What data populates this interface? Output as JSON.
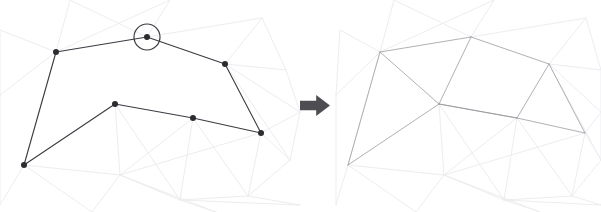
{
  "figure": {
    "width": 601,
    "height": 212,
    "background_color": "#ffffff"
  },
  "colors": {
    "polygon_stroke": "#3b3b42",
    "vertex_fill": "#2b2b30",
    "highlight_circle_stroke": "#3b3b42",
    "triangulation_stroke": "#8f8f96",
    "background_mesh_stroke": "#ededf0",
    "arrow_fill": "#4d4d52"
  },
  "strokes": {
    "polygon_width": 1.1,
    "triangulation_width": 0.7,
    "background_mesh_width": 1.0,
    "highlight_circle_width": 1.2,
    "vertex_radius": 3.0,
    "highlight_circle_radius": 13.0
  },
  "arrow": {
    "name": "right-arrow",
    "glyph": "⮕",
    "x": 300,
    "y": 95,
    "width": 30,
    "height": 21,
    "direction": "right"
  },
  "left_panel": {
    "name": "input-polygon-panel",
    "offset_x": 0,
    "highlight": {
      "name": "selected-vertex-highlight",
      "cx": 147,
      "cy": 37,
      "r": 13
    },
    "vertices": [
      {
        "id": "v0",
        "label": "left-apex",
        "x": 56,
        "y": 52
      },
      {
        "id": "v1",
        "label": "top-selected",
        "x": 147,
        "y": 37
      },
      {
        "id": "v2",
        "label": "right-upper",
        "x": 225,
        "y": 64
      },
      {
        "id": "v3",
        "label": "right-lower",
        "x": 261,
        "y": 133
      },
      {
        "id": "v4",
        "label": "bottom-mid",
        "x": 193,
        "y": 118
      },
      {
        "id": "v5",
        "label": "bottom-peak",
        "x": 115,
        "y": 104
      },
      {
        "id": "v6",
        "label": "bottom-left",
        "x": 24,
        "y": 165
      }
    ],
    "polygon_edges": [
      [
        0,
        1
      ],
      [
        1,
        2
      ],
      [
        2,
        3
      ],
      [
        3,
        4
      ],
      [
        4,
        5
      ],
      [
        5,
        6
      ],
      [
        6,
        0
      ]
    ],
    "triangulation_edges": []
  },
  "right_panel": {
    "name": "triangulated-polygon-panel",
    "offset_x": 324,
    "highlight": null,
    "vertices": [
      {
        "id": "v0",
        "label": "left-apex",
        "x": 380,
        "y": 52
      },
      {
        "id": "v1",
        "label": "top-center",
        "x": 471,
        "y": 37
      },
      {
        "id": "v2",
        "label": "right-upper",
        "x": 549,
        "y": 64
      },
      {
        "id": "v3",
        "label": "right-lower",
        "x": 585,
        "y": 133
      },
      {
        "id": "v4",
        "label": "bottom-mid",
        "x": 517,
        "y": 118
      },
      {
        "id": "v5",
        "label": "bottom-peak",
        "x": 439,
        "y": 104
      },
      {
        "id": "v6",
        "label": "bottom-left",
        "x": 348,
        "y": 165
      }
    ],
    "polygon_edges": [
      [
        0,
        1
      ],
      [
        1,
        2
      ],
      [
        2,
        3
      ],
      [
        3,
        4
      ],
      [
        4,
        5
      ],
      [
        5,
        6
      ],
      [
        6,
        0
      ]
    ],
    "triangulation_edges": [
      [
        0,
        5
      ],
      [
        1,
        5
      ],
      [
        5,
        4
      ],
      [
        2,
        4
      ]
    ]
  },
  "background_mesh": {
    "name": "faint-background-mesh",
    "left": {
      "nodes": [
        {
          "x": 56,
          "y": 52
        },
        {
          "x": 147,
          "y": 37
        },
        {
          "x": 225,
          "y": 64
        },
        {
          "x": 261,
          "y": 133
        },
        {
          "x": 193,
          "y": 118
        },
        {
          "x": 115,
          "y": 104
        },
        {
          "x": 24,
          "y": 165
        },
        {
          "x": 120,
          "y": 175
        },
        {
          "x": 180,
          "y": 200
        },
        {
          "x": 248,
          "y": 196
        },
        {
          "x": 290,
          "y": 160
        },
        {
          "x": 286,
          "y": 70
        },
        {
          "x": 262,
          "y": 18
        },
        {
          "x": 170,
          "y": 0
        },
        {
          "x": 70,
          "y": 0
        },
        {
          "x": 0,
          "y": 30
        },
        {
          "x": 0,
          "y": 95
        },
        {
          "x": 0,
          "y": 205
        },
        {
          "x": 92,
          "y": 212
        },
        {
          "x": 300,
          "y": 112
        },
        {
          "x": 300,
          "y": 205
        },
        {
          "x": 216,
          "y": 212
        }
      ],
      "edges": [
        [
          0,
          14
        ],
        [
          0,
          13
        ],
        [
          0,
          15
        ],
        [
          0,
          16
        ],
        [
          0,
          6
        ],
        [
          1,
          13
        ],
        [
          1,
          12
        ],
        [
          1,
          14
        ],
        [
          2,
          12
        ],
        [
          2,
          11
        ],
        [
          2,
          19
        ],
        [
          2,
          10
        ],
        [
          3,
          10
        ],
        [
          3,
          19
        ],
        [
          3,
          9
        ],
        [
          3,
          7
        ],
        [
          4,
          7
        ],
        [
          4,
          9
        ],
        [
          4,
          8
        ],
        [
          5,
          7
        ],
        [
          5,
          8
        ],
        [
          6,
          17
        ],
        [
          6,
          18
        ],
        [
          6,
          7
        ],
        [
          7,
          18
        ],
        [
          7,
          21
        ],
        [
          7,
          8
        ],
        [
          8,
          21
        ],
        [
          8,
          20
        ],
        [
          8,
          9
        ],
        [
          9,
          20
        ],
        [
          9,
          10
        ],
        [
          10,
          19
        ],
        [
          11,
          12
        ],
        [
          11,
          19
        ],
        [
          16,
          17
        ],
        [
          15,
          16
        ]
      ]
    },
    "right": {
      "nodes": [
        {
          "x": 380,
          "y": 52
        },
        {
          "x": 471,
          "y": 37
        },
        {
          "x": 549,
          "y": 64
        },
        {
          "x": 585,
          "y": 133
        },
        {
          "x": 517,
          "y": 118
        },
        {
          "x": 439,
          "y": 104
        },
        {
          "x": 348,
          "y": 165
        },
        {
          "x": 444,
          "y": 175
        },
        {
          "x": 504,
          "y": 200
        },
        {
          "x": 572,
          "y": 196
        },
        {
          "x": 601,
          "y": 160
        },
        {
          "x": 601,
          "y": 70
        },
        {
          "x": 586,
          "y": 18
        },
        {
          "x": 494,
          "y": 0
        },
        {
          "x": 394,
          "y": 0
        },
        {
          "x": 340,
          "y": 30
        },
        {
          "x": 336,
          "y": 95
        },
        {
          "x": 336,
          "y": 205
        },
        {
          "x": 416,
          "y": 212
        },
        {
          "x": 601,
          "y": 112
        },
        {
          "x": 601,
          "y": 205
        },
        {
          "x": 540,
          "y": 212
        }
      ],
      "edges": [
        [
          0,
          14
        ],
        [
          0,
          13
        ],
        [
          0,
          15
        ],
        [
          0,
          16
        ],
        [
          0,
          6
        ],
        [
          1,
          13
        ],
        [
          1,
          12
        ],
        [
          1,
          14
        ],
        [
          2,
          12
        ],
        [
          2,
          11
        ],
        [
          2,
          19
        ],
        [
          2,
          10
        ],
        [
          3,
          10
        ],
        [
          3,
          19
        ],
        [
          3,
          9
        ],
        [
          3,
          7
        ],
        [
          4,
          7
        ],
        [
          4,
          9
        ],
        [
          4,
          8
        ],
        [
          5,
          7
        ],
        [
          5,
          8
        ],
        [
          6,
          17
        ],
        [
          6,
          18
        ],
        [
          6,
          7
        ],
        [
          7,
          18
        ],
        [
          7,
          21
        ],
        [
          7,
          8
        ],
        [
          8,
          21
        ],
        [
          8,
          20
        ],
        [
          8,
          9
        ],
        [
          9,
          20
        ],
        [
          9,
          10
        ],
        [
          10,
          19
        ],
        [
          11,
          12
        ],
        [
          11,
          19
        ],
        [
          16,
          17
        ],
        [
          15,
          16
        ]
      ]
    }
  }
}
